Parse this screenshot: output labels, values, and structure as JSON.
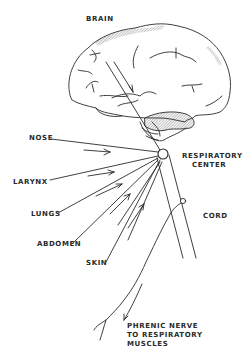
{
  "diagram": {
    "labels": {
      "brain": "BRAIN",
      "nose": "NOSE",
      "larynx": "LARYNX",
      "lungs": "LUNGS",
      "abdomen": "ABDOMEN",
      "skin": "SKIN",
      "respiratory_center_line1": "RESPIRATORY",
      "respiratory_center_line2": "CENTER",
      "cord": "CORD",
      "phrenic_line1": "PHRENIC NERVE",
      "phrenic_line2": "TO RESPIRATORY",
      "phrenic_line3": "MUSCLES"
    },
    "colors": {
      "ink": "#2a2a2a",
      "background": "#ffffff"
    }
  }
}
